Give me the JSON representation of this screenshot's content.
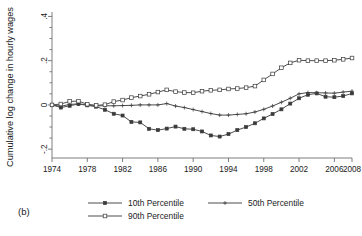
{
  "figure": {
    "panel_label": "(b)",
    "background_color": "#ffffff",
    "line_color": "#4d4d4d"
  },
  "chart_data": {
    "type": "line",
    "title": "",
    "xlabel": "",
    "ylabel": "Cumulative log change in hourly wages",
    "xlim": [
      1974,
      2008
    ],
    "ylim": [
      -0.24,
      0.42
    ],
    "grid": false,
    "legend_position": "bottom",
    "xticks": [
      1974,
      1978,
      1982,
      1986,
      1990,
      1994,
      1998,
      2002,
      2006,
      2008
    ],
    "xtick_labels": [
      "1974",
      "1978",
      "1982",
      "1986",
      "1990",
      "1994",
      "1998",
      "2002",
      "2006",
      "2008"
    ],
    "yticks": [
      -0.2,
      0,
      0.2,
      0.4
    ],
    "ytick_labels": [
      "-.2",
      "0",
      ".2",
      ".4"
    ],
    "yminorticks": [
      -0.15,
      -0.1,
      -0.05,
      0.05,
      0.1,
      0.15,
      0.25,
      0.3,
      0.35
    ],
    "x": [
      1974,
      1975,
      1976,
      1977,
      1978,
      1979,
      1980,
      1981,
      1982,
      1983,
      1984,
      1985,
      1986,
      1987,
      1988,
      1989,
      1990,
      1991,
      1992,
      1993,
      1994,
      1995,
      1996,
      1997,
      1998,
      1999,
      2000,
      2001,
      2002,
      2003,
      2004,
      2005,
      2006,
      2007,
      2008
    ],
    "series": [
      {
        "name": "10th Percentile",
        "marker": "filled-square",
        "values": [
          0.0,
          -0.012,
          -0.004,
          0.004,
          -0.002,
          -0.008,
          -0.022,
          -0.04,
          -0.048,
          -0.077,
          -0.079,
          -0.108,
          -0.114,
          -0.107,
          -0.098,
          -0.108,
          -0.11,
          -0.12,
          -0.138,
          -0.143,
          -0.132,
          -0.114,
          -0.1,
          -0.083,
          -0.061,
          -0.041,
          -0.02,
          0.006,
          0.03,
          0.046,
          0.052,
          0.037,
          0.035,
          0.04,
          0.052
        ]
      },
      {
        "name": "50th Percentile",
        "marker": "plus",
        "values": [
          0.0,
          -0.006,
          0.002,
          0.005,
          0.0,
          -0.004,
          -0.004,
          -0.004,
          -0.003,
          -0.002,
          0.0,
          0.0,
          0.0,
          0.006,
          -0.005,
          -0.012,
          -0.021,
          -0.03,
          -0.039,
          -0.046,
          -0.046,
          -0.043,
          -0.04,
          -0.032,
          -0.02,
          -0.005,
          0.012,
          0.03,
          0.05,
          0.056,
          0.055,
          0.054,
          0.053,
          0.058,
          0.062
        ]
      },
      {
        "name": "90th Percentile",
        "marker": "open-square",
        "values": [
          0.0,
          0.004,
          0.016,
          0.017,
          0.003,
          -0.002,
          0.001,
          0.015,
          0.022,
          0.033,
          0.04,
          0.048,
          0.058,
          0.068,
          0.06,
          0.056,
          0.055,
          0.062,
          0.066,
          0.068,
          0.072,
          0.074,
          0.078,
          0.085,
          0.113,
          0.14,
          0.168,
          0.19,
          0.202,
          0.2,
          0.2,
          0.2,
          0.202,
          0.206,
          0.212
        ]
      }
    ],
    "legend": [
      {
        "label": "10th Percentile",
        "marker": "filled-square"
      },
      {
        "label": "50th Percentile",
        "marker": "plus"
      },
      {
        "label": "90th Percentile",
        "marker": "open-square"
      }
    ]
  }
}
